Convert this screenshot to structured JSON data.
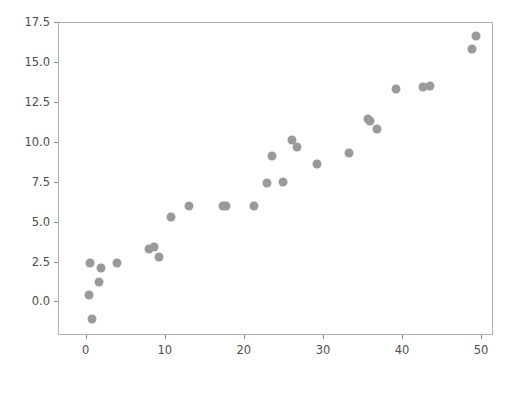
{
  "chart_data": {
    "type": "scatter",
    "title": "",
    "xlabel": "",
    "ylabel": "",
    "xlim": [
      -3.5,
      51.5
    ],
    "ylim": [
      -2.1,
      17.5
    ],
    "grid": false,
    "legend": null,
    "marker": {
      "color": "#9a9a9a",
      "shape": "circle",
      "size": 9
    },
    "background": "#ffffff",
    "axis_color": "#b0b0b0",
    "tick_label_color": "#4d4d4d",
    "xticks": [
      0,
      10,
      20,
      30,
      40,
      50
    ],
    "xtick_labels": [
      "0",
      "10",
      "20",
      "30",
      "40",
      "50"
    ],
    "yticks": [
      0.0,
      2.5,
      5.0,
      7.5,
      10.0,
      12.5,
      15.0,
      17.5
    ],
    "ytick_labels": [
      "0.0",
      "2.5",
      "5.0",
      "7.5",
      "10.0",
      "12.5",
      "15.0",
      "17.5"
    ],
    "points": [
      {
        "x": 0.5,
        "y": 2.4
      },
      {
        "x": 1.9,
        "y": 2.1
      },
      {
        "x": 3.9,
        "y": 2.4
      },
      {
        "x": 1.7,
        "y": 1.2
      },
      {
        "x": 0.4,
        "y": 0.4
      },
      {
        "x": 0.8,
        "y": -1.1
      },
      {
        "x": 8.0,
        "y": 3.3
      },
      {
        "x": 8.6,
        "y": 3.4
      },
      {
        "x": 9.3,
        "y": 2.8
      },
      {
        "x": 10.8,
        "y": 5.3
      },
      {
        "x": 13.0,
        "y": 6.0
      },
      {
        "x": 17.3,
        "y": 6.0
      },
      {
        "x": 17.8,
        "y": 6.0
      },
      {
        "x": 21.3,
        "y": 6.0
      },
      {
        "x": 22.9,
        "y": 7.4
      },
      {
        "x": 23.5,
        "y": 9.1
      },
      {
        "x": 24.9,
        "y": 7.5
      },
      {
        "x": 26.1,
        "y": 10.1
      },
      {
        "x": 26.7,
        "y": 9.7
      },
      {
        "x": 29.2,
        "y": 8.6
      },
      {
        "x": 33.3,
        "y": 9.3
      },
      {
        "x": 35.7,
        "y": 11.4
      },
      {
        "x": 36.0,
        "y": 11.3
      },
      {
        "x": 36.8,
        "y": 10.8
      },
      {
        "x": 39.2,
        "y": 13.3
      },
      {
        "x": 42.7,
        "y": 13.4
      },
      {
        "x": 43.5,
        "y": 13.5
      },
      {
        "x": 48.8,
        "y": 15.8
      },
      {
        "x": 49.4,
        "y": 16.6
      }
    ]
  }
}
